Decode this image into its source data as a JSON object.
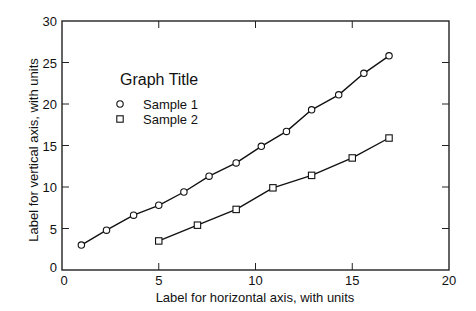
{
  "chart_data": {
    "type": "scatter",
    "title": "",
    "legend_title": "Graph Title",
    "xlabel": "Label for horizontal axis, with units",
    "ylabel": "Label for vertical axis, with units",
    "xlim": [
      0,
      20
    ],
    "ylim": [
      0,
      30
    ],
    "xticks": [
      0,
      5,
      10,
      15,
      20
    ],
    "yticks": [
      0,
      5,
      10,
      15,
      20,
      25,
      30
    ],
    "grid": false,
    "legend_position": "upper-left (inside)",
    "series": [
      {
        "name": "Sample 1",
        "marker": "circle",
        "fit_line": true,
        "x": [
          1.0,
          2.3,
          3.7,
          5.0,
          6.3,
          7.6,
          9.0,
          10.3,
          11.6,
          12.9,
          14.3,
          15.6,
          16.9
        ],
        "y": [
          3.0,
          4.8,
          6.6,
          7.8,
          9.4,
          11.3,
          12.9,
          14.9,
          16.7,
          19.3,
          21.1,
          23.7,
          25.8
        ]
      },
      {
        "name": "Sample 2",
        "marker": "square",
        "fit_line": true,
        "x": [
          5.0,
          7.0,
          9.0,
          10.9,
          12.9,
          15.0,
          16.9
        ],
        "y": [
          3.5,
          5.4,
          7.3,
          9.9,
          11.4,
          13.5,
          15.9
        ]
      }
    ]
  },
  "colors": {
    "axis": "#222222",
    "line": "#111111",
    "marker_fill": "#ffffff",
    "background": "#ffffff"
  }
}
